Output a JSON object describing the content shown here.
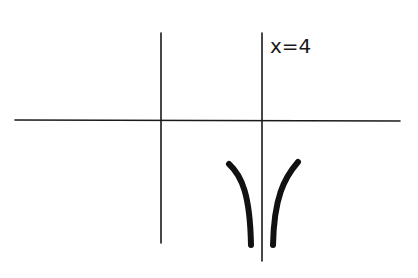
{
  "diagram": {
    "asymptote_label": "x=4",
    "colors": {
      "background": "#ffffff",
      "ink": "#1a1a1a"
    },
    "elements": {
      "x_axis": {
        "x1": 15,
        "y1": 120,
        "x2": 400,
        "y2": 121
      },
      "y_axis": {
        "x1": 161,
        "y1": 33,
        "x2": 161,
        "y2": 243
      },
      "asymptote": {
        "x1": 262,
        "y1": 33,
        "x2": 262,
        "y2": 261
      },
      "left_branch": "M229,164 C242,176 250,195 251,245",
      "right_branch": "M298,162 C284,178 274,198 273,245"
    }
  }
}
